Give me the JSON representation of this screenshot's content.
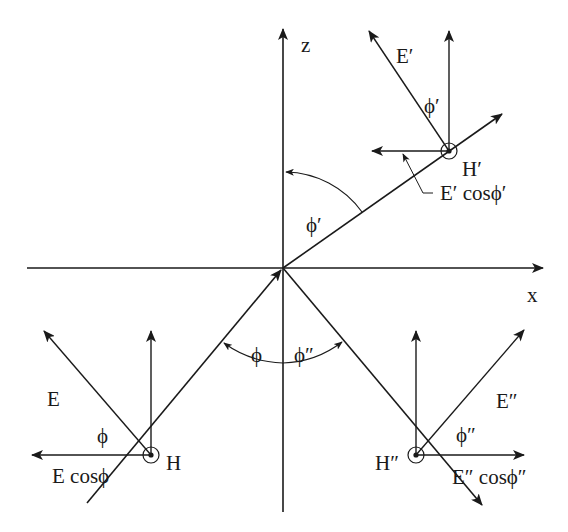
{
  "diagram": {
    "axes": {
      "z_label": "z",
      "x_label": "x"
    },
    "angles": {
      "incident": "ϕ",
      "reflected": "ϕ″",
      "upper": "ϕ′"
    },
    "incident_wave": {
      "E_label": "E",
      "H_label": "H",
      "angle_label": "ϕ",
      "component_label": "E cosϕ"
    },
    "upper_wave": {
      "E_label": "E′",
      "H_label": "H′",
      "angle_label": "ϕ′",
      "component_label": "E′ cosϕ′"
    },
    "reflected_wave": {
      "E_label": "E″",
      "H_label": "H″",
      "angle_label": "ϕ″",
      "component_label": "E″ cosϕ″"
    },
    "colors": {
      "line": "#1a1a1a",
      "background": "#ffffff"
    }
  }
}
